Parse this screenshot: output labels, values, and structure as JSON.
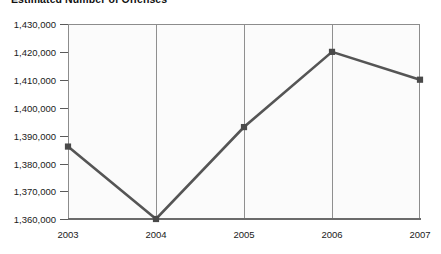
{
  "chart_data": {
    "type": "line",
    "title": "Estimated Number of Offenses",
    "xlabel": "",
    "ylabel": "",
    "categories": [
      "2003",
      "2004",
      "2005",
      "2006",
      "2007"
    ],
    "x": [
      2003,
      2004,
      2005,
      2006,
      2007
    ],
    "values": [
      1386000,
      1360000,
      1393000,
      1420000,
      1410000
    ],
    "series": [
      {
        "name": "Estimated Number of Offenses",
        "values": [
          1386000,
          1360000,
          1393000,
          1420000,
          1410000
        ]
      }
    ],
    "ylim": [
      1360000,
      1430000
    ],
    "yticks": [
      1360000,
      1370000,
      1380000,
      1390000,
      1400000,
      1410000,
      1420000,
      1430000
    ],
    "ytick_labels": [
      "1,360,000",
      "1,370,000",
      "1,380,000",
      "1,390,000",
      "1,400,000",
      "1,410,000",
      "1,420,000",
      "1,430,000"
    ],
    "xtick_labels": [
      "2003",
      "2004",
      "2005",
      "2006",
      "2007"
    ],
    "grid": "vertical-only",
    "legend": "none",
    "line_color": "#555555",
    "marker_color": "#4a4a4a",
    "marker_shape": "square",
    "plot_background": "#fbfbfb",
    "axis_color": "#8c8c8c"
  },
  "axis": {
    "y_labels": [
      "1,430,000",
      "1,420,000",
      "1,410,000",
      "1,400,000",
      "1,390,000",
      "1,380,000",
      "1,370,000",
      "1,360,000"
    ],
    "x_labels": [
      "2003",
      "2004",
      "2005",
      "2006",
      "2007"
    ]
  }
}
